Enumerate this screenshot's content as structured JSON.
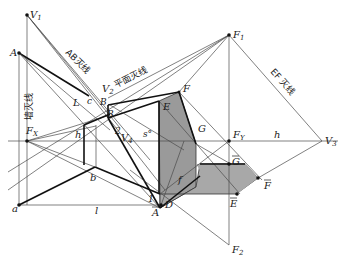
{
  "diagram": {
    "type": "perspective construction",
    "labels": {
      "V1": "V",
      "V1_sub": "1",
      "V2": "V",
      "V2_sub": "2",
      "V3": "V",
      "V3_sub": "3",
      "V4": "V",
      "V4_sub": "4",
      "F1": "F",
      "F1_sub": "1",
      "F2": "F",
      "F2_sub": "2",
      "FX": "F",
      "FX_sub": "X",
      "FY": "F",
      "FY_sub": "Y",
      "A": "A",
      "a": "a",
      "b": "b",
      "B_upper": "B",
      "B_lower": "B",
      "c": "c",
      "L": "L",
      "h_left": "h",
      "h_right": "h",
      "l": "l",
      "num1": "1",
      "num2": "2",
      "s0": "s°",
      "D": "D",
      "A_bar": "A",
      "E": "E",
      "E_bar": "E",
      "F": "F",
      "F_bar": "F",
      "G": "G",
      "G_bar": "G",
      "f": "f"
    },
    "annotations": {
      "ab_vanishing_line": "AB灭线",
      "plane_vanishing_line": "平面灭线",
      "ef_vanishing_line": "EF 灭线",
      "wall_vanishing_line": "墙灭线"
    },
    "colors": {
      "shade_wall": "#9a9a9a",
      "shade_floor": "#a8a8a8",
      "line": "#4a4a4a",
      "bold": "#111111"
    }
  }
}
